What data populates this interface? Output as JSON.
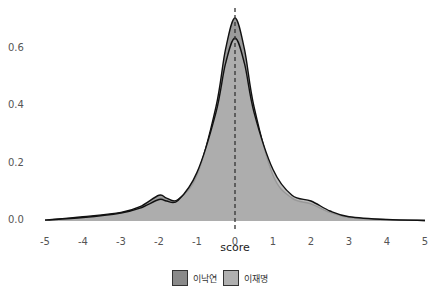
{
  "header": {
    "cut_text": "..."
  },
  "chart_data": {
    "type": "area",
    "title": "",
    "xlabel": "score",
    "ylabel": "",
    "xlim": [
      -5,
      5
    ],
    "ylim": [
      0,
      0.72
    ],
    "x_ticks": [
      "-5",
      "-4",
      "-3",
      "-2",
      "-1",
      "0",
      "1",
      "2",
      "3",
      "4",
      "5"
    ],
    "y_ticks": [
      "0.0",
      "0.2",
      "0.4",
      "0.6"
    ],
    "grid": false,
    "vline": {
      "x": 0,
      "style": "dashed"
    },
    "legend_position": "bottom",
    "series": [
      {
        "name": "이낙연",
        "fill": "#8a8a8a",
        "x": [
          -5,
          -4,
          -3,
          -2.5,
          -2,
          -1.8,
          -1.5,
          -1,
          -0.5,
          -0.25,
          0,
          0.25,
          0.5,
          1,
          1.5,
          2,
          2.5,
          3,
          4,
          5
        ],
        "y": [
          0.003,
          0.015,
          0.03,
          0.05,
          0.09,
          0.08,
          0.075,
          0.16,
          0.4,
          0.6,
          0.71,
          0.6,
          0.4,
          0.16,
          0.08,
          0.06,
          0.03,
          0.012,
          0.004,
          0.002
        ]
      },
      {
        "name": "이재명",
        "fill": "#b0b0b0",
        "x": [
          -5,
          -4,
          -3,
          -2.5,
          -2,
          -1.8,
          -1.5,
          -1,
          -0.5,
          -0.25,
          0,
          0.25,
          0.5,
          1,
          1.5,
          2,
          2.5,
          3,
          4,
          5
        ],
        "y": [
          0.003,
          0.012,
          0.028,
          0.045,
          0.075,
          0.07,
          0.072,
          0.17,
          0.38,
          0.55,
          0.64,
          0.55,
          0.38,
          0.18,
          0.09,
          0.07,
          0.035,
          0.015,
          0.005,
          0.002
        ]
      }
    ]
  },
  "legend": {
    "items": [
      {
        "label": "이낙연",
        "color": "#8a8a8a"
      },
      {
        "label": "이재명",
        "color": "#b0b0b0"
      }
    ]
  },
  "axes": {
    "y_labels": [
      "0.6",
      "0.4",
      "0.2",
      "0.0"
    ],
    "x_labels": [
      "-5",
      "-4",
      "-3",
      "-2",
      "-1",
      "0",
      "1",
      "2",
      "3",
      "4",
      "5"
    ],
    "x_title": "score"
  }
}
